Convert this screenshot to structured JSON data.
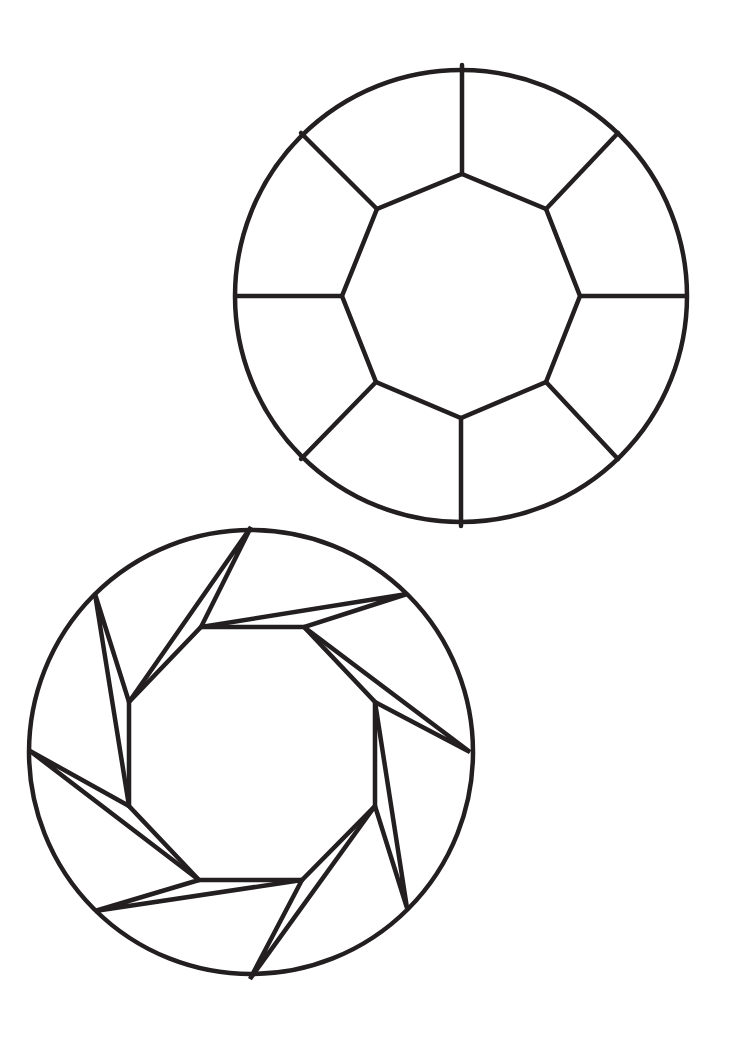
{
  "page": {
    "background": "#ffffff",
    "stroke_color": "#231f20"
  },
  "designs": [
    {
      "name": "octagon-ring-design",
      "circle": {
        "cx": 461,
        "cy": 296,
        "r": 226
      },
      "inner_octagon": [
        [
          462,
          174
        ],
        [
          546,
          209
        ],
        [
          580,
          296
        ],
        [
          546,
          382
        ],
        [
          461,
          418
        ],
        [
          376,
          382
        ],
        [
          342,
          296
        ],
        [
          377,
          209
        ]
      ],
      "spokes": [
        [
          [
            462,
            174
          ],
          [
            462,
            65
          ]
        ],
        [
          [
            546,
            209
          ],
          [
            618,
            133
          ]
        ],
        [
          [
            580,
            296
          ],
          [
            686,
            296
          ]
        ],
        [
          [
            546,
            382
          ],
          [
            618,
            459
          ]
        ],
        [
          [
            461,
            418
          ],
          [
            461,
            526
          ]
        ],
        [
          [
            376,
            382
          ],
          [
            301,
            459
          ]
        ],
        [
          [
            342,
            296
          ],
          [
            236,
            296
          ]
        ],
        [
          [
            377,
            209
          ],
          [
            301,
            133
          ]
        ]
      ]
    },
    {
      "name": "star-octagon-design",
      "circle": {
        "cx": 251,
        "cy": 752,
        "r": 222
      },
      "star_points": [
        [
          251,
          527
        ],
        [
          407,
          594
        ],
        [
          470,
          752
        ],
        [
          407,
          908
        ],
        [
          250,
          979
        ],
        [
          95,
          911
        ],
        [
          30,
          751
        ],
        [
          95,
          594
        ]
      ],
      "inner_octagon": [
        [
          201,
          627
        ],
        [
          304,
          627
        ],
        [
          375,
          702
        ],
        [
          375,
          806
        ],
        [
          302,
          880
        ],
        [
          199,
          880
        ],
        [
          129,
          806
        ],
        [
          129,
          702
        ]
      ]
    }
  ]
}
